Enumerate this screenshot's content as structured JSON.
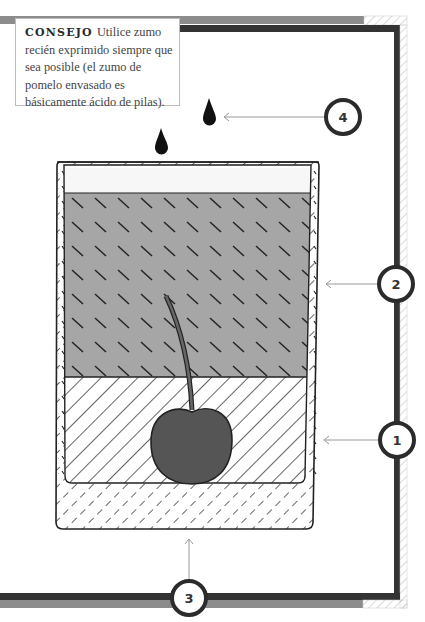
{
  "tip": {
    "title": "CONSEJO",
    "text": "Utilice zumo recién exprimido siempre que sea posible (el zumo de pomelo envasado es básicamente ácido de pilas)."
  },
  "callouts": [
    {
      "number": "1",
      "target": "hatched-layer"
    },
    {
      "number": "2",
      "target": "gray-layer"
    },
    {
      "number": "3",
      "target": "glass-base"
    },
    {
      "number": "4",
      "target": "drops"
    }
  ],
  "colors": {
    "frame_dark": "#333333",
    "frame_gray": "#8c8c8c",
    "liquid_gray": "#a6a6a6",
    "cherry": "#555555",
    "glass_outline": "#222222"
  }
}
